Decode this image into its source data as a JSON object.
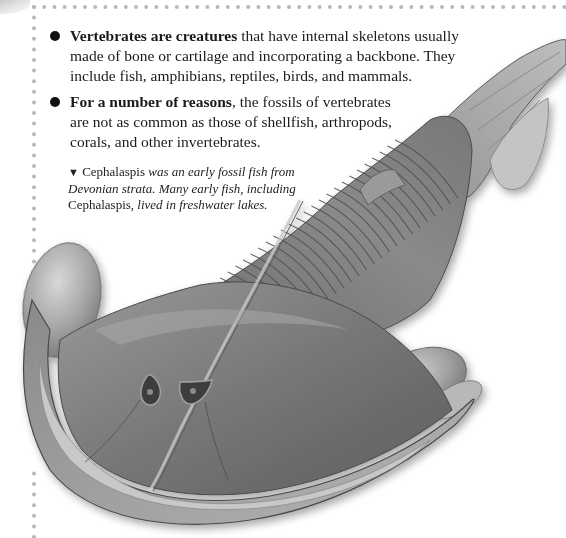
{
  "page": {
    "accent_dot_color": "#b8b8b8",
    "text_color": "#1a1a1a"
  },
  "bullets": [
    {
      "icon": "bullet-dot",
      "lead": "Vertebrates are creatures",
      "rest": " that have internal skeletons usually made of bone or cartilage and incorporating a backbone. They include fish, amphibians, reptiles, birds, and mammals."
    },
    {
      "icon": "bullet-dot",
      "lead": "For a number of reasons",
      "rest": ", the fossils of vertebrates are not as common as those of shellfish, arthropods, corals, and other invertebrates."
    }
  ],
  "caption": {
    "icon": "triangle-down",
    "pointer": "▼",
    "parts": [
      {
        "text": " Cephalaspis",
        "style": "roman"
      },
      {
        "text": " was an early fossil fish from Devonian strata. Many early fish, including ",
        "style": "italic"
      },
      {
        "text": "Cephalaspis,",
        "style": "roman"
      },
      {
        "text": " lived in freshwater lakes.",
        "style": "italic"
      }
    ]
  },
  "illustration": {
    "subject": "Cephalaspis fossil fish",
    "palette": [
      "#4a4a4a",
      "#6e6e6e",
      "#8c8c8c",
      "#a8a8a8",
      "#c6c6c6",
      "#dedede"
    ]
  }
}
